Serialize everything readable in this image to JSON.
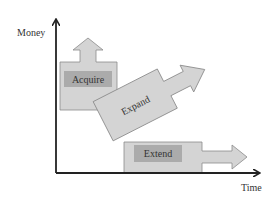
{
  "axes": {
    "y_label": "Money",
    "x_label": "Time"
  },
  "stages": [
    {
      "label": "Acquire",
      "direction": "up"
    },
    {
      "label": "Expand",
      "direction": "diagonal-up-right"
    },
    {
      "label": "Extend",
      "direction": "right"
    }
  ],
  "colors": {
    "shape_fill": "#d4d4d4",
    "shape_stroke": "#8a8a8a",
    "label_box": "#ababab",
    "axis": "#222222",
    "text": "#333333"
  }
}
